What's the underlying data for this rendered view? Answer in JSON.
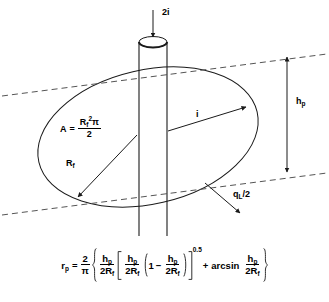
{
  "figure": {
    "stroke_color": "#1a1a1a",
    "dash_color": "#555555",
    "background": "#ffffff"
  },
  "labels": {
    "inflow": {
      "text": "2i",
      "description": "downward arrow into top of cylinder"
    },
    "flow_i": {
      "text": "i",
      "description": "in-plane flow arrow across ellipse"
    },
    "height": {
      "base": "h",
      "sub": "p",
      "description": "vertical distance between dashed tangent lines"
    },
    "flux": {
      "base": "q",
      "sub": "L",
      "suffix": "/2",
      "description": "arrow to lower dashed tangent line"
    },
    "radius": {
      "base": "R",
      "sub": "f",
      "description": "radius arrow of ellipse"
    },
    "area": {
      "lhs": "A",
      "equals": "=",
      "numerator_base": "R",
      "numerator_sub": "f",
      "numerator_sup": "2",
      "numerator_pi": "π",
      "denominator": "2"
    }
  },
  "formula": {
    "lhs_base": "r",
    "lhs_sub": "p",
    "equals": "=",
    "coefficient": {
      "num": "2",
      "den": "π"
    },
    "term1": {
      "num_base": "h",
      "num_sub": "p",
      "den": "2R",
      "den_sub": "f"
    },
    "term2": {
      "num_base": "h",
      "num_sub": "p",
      "den": "2R",
      "den_sub": "f"
    },
    "one": "1",
    "minus": "−",
    "term3": {
      "num_base": "h",
      "num_sub": "p",
      "den": "2R",
      "den_sub": "f"
    },
    "exponent": "0.5",
    "plus": "+",
    "arcsin": "arcsin",
    "term4": {
      "num_base": "h",
      "num_sub": "p",
      "den": "2R",
      "den_sub": "f"
    }
  },
  "geometry": {
    "ellipse": {
      "cx": 148,
      "cy": 137,
      "rx": 112,
      "ry": 67,
      "rotation_deg": -13
    },
    "cylinder": {
      "left_x": 139,
      "right_x": 167,
      "top_y": 42,
      "bottom_y": 236,
      "cap_ry": 6
    },
    "dashed_line_upper": {
      "x1": 2,
      "y1": 96,
      "x2": 327,
      "y2": 54
    },
    "dashed_line_lower": {
      "x1": 2,
      "y1": 215,
      "x2": 327,
      "y2": 173
    },
    "dimension_arrow": {
      "x": 287,
      "y_top": 57,
      "y_bottom": 172
    }
  }
}
